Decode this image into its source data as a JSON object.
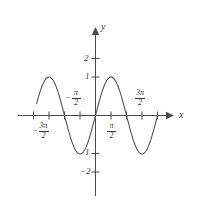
{
  "figure": {
    "background_color": "#ffffff",
    "stroke_color": "#555555",
    "axis_color": "#4a4a4a"
  },
  "axes": {
    "x_axis_label": "x",
    "y_axis_label": "y"
  },
  "y_ticks": [
    {
      "label": "2",
      "value": 2
    },
    {
      "label": "1",
      "value": 1
    },
    {
      "label": "1",
      "value": -1
    },
    {
      "label": "−2",
      "value": -2
    }
  ],
  "x_ticks": [
    {
      "minus": "−",
      "numer": "3π",
      "denom": "2",
      "value": -4.71238898038469
    },
    {
      "minus": "−",
      "numer": "π",
      "denom": "2",
      "value": -1.570796326794897
    },
    {
      "minus": "",
      "numer": "π",
      "denom": "2",
      "value": 1.570796326794897
    },
    {
      "minus": "",
      "numer": "3π",
      "denom": "2",
      "value": 4.71238898038469
    }
  ],
  "chart_data": {
    "type": "line",
    "title": "",
    "xlabel": "x",
    "ylabel": "y",
    "xlim": [
      -5.969026041820607,
      6.283185307179586
    ],
    "ylim": [
      -2.6,
      2.8
    ],
    "grid": false,
    "legend": null,
    "series": [
      {
        "name": "y = sin(x)",
        "expression": "sin(x)",
        "amplitude": 1,
        "period": 6.283185307179586,
        "zeros": [
          -6.283185307179586,
          -3.141592653589793,
          0,
          3.141592653589793,
          6.283185307179586
        ],
        "maxima": [
          {
            "x": -4.71238898038469,
            "y": 1
          },
          {
            "x": 1.570796326794897,
            "y": 1
          }
        ],
        "minima": [
          {
            "x": -1.570796326794897,
            "y": -1
          },
          {
            "x": 4.71238898038469,
            "y": -1
          }
        ]
      }
    ],
    "x_tick_values": [
      -4.71238898038469,
      -3.141592653589793,
      -1.570796326794897,
      1.570796326794897,
      3.141592653589793,
      4.71238898038469
    ],
    "y_tick_values": [
      -2,
      -1,
      1,
      2
    ]
  }
}
